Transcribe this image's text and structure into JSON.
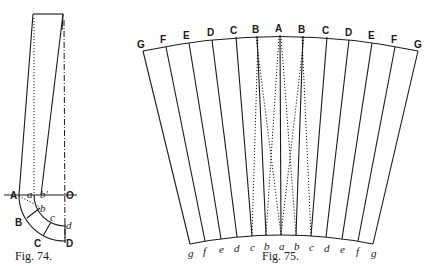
{
  "fig74": {
    "caption": "Fig. 74.",
    "labels": {
      "A": "A",
      "a": "a",
      "b_prime": "b'",
      "O": "O",
      "b": "b",
      "c": "c",
      "d": "d",
      "B": "B",
      "C": "C",
      "D": "D"
    }
  },
  "fig75": {
    "caption": "Fig. 75.",
    "top_labels": [
      "G",
      "F",
      "E",
      "D",
      "C",
      "B",
      "A",
      "B",
      "C",
      "D",
      "E",
      "F",
      "G"
    ],
    "bottom_labels": [
      "g",
      "f",
      "e",
      "d",
      "c",
      "b",
      "a",
      "b",
      "c",
      "d",
      "e",
      "f",
      "g"
    ]
  }
}
